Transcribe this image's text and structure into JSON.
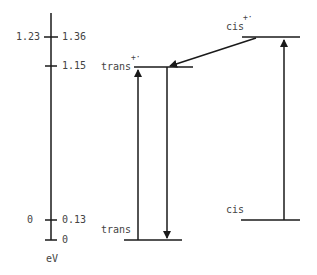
{
  "diagram": {
    "type": "energy-level-diagram",
    "axis": {
      "unit_label": "eV",
      "ticks": [
        {
          "left": "1.23",
          "right": "1.36"
        },
        {
          "left": "",
          "right": "1.15"
        },
        {
          "left": "0",
          "right": "0.13"
        },
        {
          "left": "",
          "right": "0"
        }
      ]
    },
    "levels": {
      "trans_cation": {
        "name": "trans",
        "superscript": "+·"
      },
      "cis_cation": {
        "name": "cis",
        "superscript": "+·"
      },
      "trans_neutral": {
        "name": "trans"
      },
      "cis_neutral": {
        "name": "cis"
      }
    },
    "transitions": [
      {
        "from": "trans",
        "to": "trans+·",
        "direction": "up"
      },
      {
        "from": "trans+·",
        "to": "trans",
        "direction": "down"
      },
      {
        "from": "cis",
        "to": "cis+·",
        "direction": "up"
      },
      {
        "from": "cis+·",
        "to": "trans+·",
        "direction": "diagonal"
      }
    ]
  }
}
